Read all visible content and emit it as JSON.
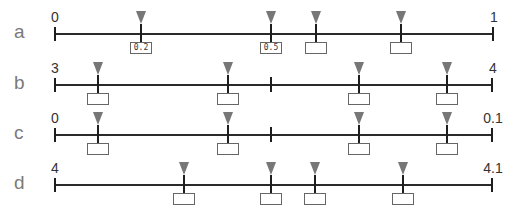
{
  "worksheet": {
    "rows": [
      {
        "label": "a",
        "start": "0",
        "end": "1",
        "line_y": 33,
        "x_start": 55,
        "x_end": 493,
        "mid_tick": null,
        "markers": [
          {
            "x": 141,
            "answer": "0.2"
          },
          {
            "x": 271,
            "answer": "0.5"
          },
          {
            "x": 316,
            "answer": ""
          },
          {
            "x": 401,
            "answer": ""
          }
        ]
      },
      {
        "label": "b",
        "start": "3",
        "end": "4",
        "line_y": 84,
        "x_start": 55,
        "x_end": 492,
        "mid_tick": 271,
        "markers": [
          {
            "x": 98,
            "answer": ""
          },
          {
            "x": 228,
            "answer": ""
          },
          {
            "x": 359,
            "answer": ""
          },
          {
            "x": 447,
            "answer": ""
          }
        ]
      },
      {
        "label": "c",
        "start": "0",
        "end": "0.1",
        "line_y": 134,
        "x_start": 55,
        "x_end": 492,
        "mid_tick": 271,
        "markers": [
          {
            "x": 98,
            "answer": ""
          },
          {
            "x": 228,
            "answer": ""
          },
          {
            "x": 359,
            "answer": ""
          },
          {
            "x": 447,
            "answer": ""
          }
        ]
      },
      {
        "label": "d",
        "start": "4",
        "end": "4.1",
        "line_y": 184,
        "x_start": 55,
        "x_end": 492,
        "mid_tick": null,
        "markers": [
          {
            "x": 184,
            "answer": ""
          },
          {
            "x": 271,
            "answer": ""
          },
          {
            "x": 315,
            "answer": ""
          },
          {
            "x": 403,
            "answer": ""
          }
        ]
      }
    ]
  },
  "colors": {
    "axis": "#2a2a2a",
    "arrow": "#777777",
    "row_label": "#7a7a7a",
    "box_border": "#666666"
  }
}
